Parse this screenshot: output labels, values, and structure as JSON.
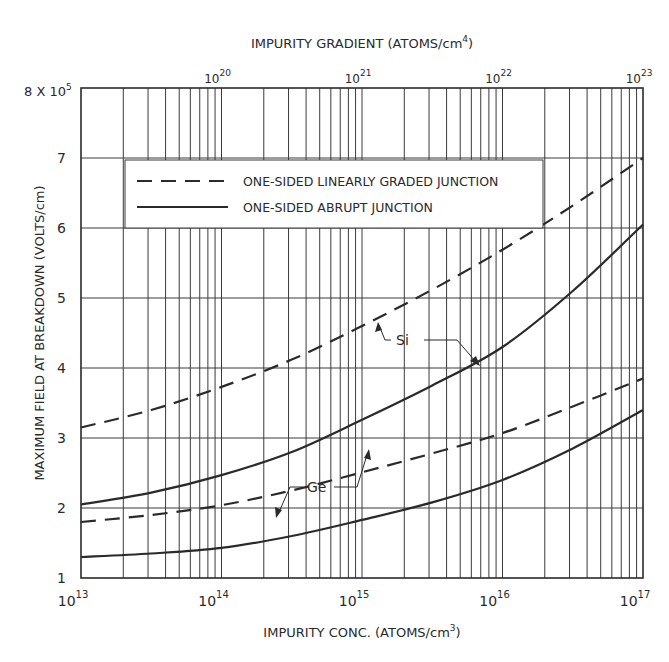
{
  "chart_data": {
    "type": "line",
    "title": "",
    "xlabel": "IMPURITY CONC. (ATOMS/cm3)",
    "xlabel_parts": {
      "main": "IMPURITY  CONC.  (ATOMS/cm",
      "sup": "3",
      "end": ")"
    },
    "x2label": "IMPURITY GRADIENT (ATOMS/cm4)",
    "x2label_parts": {
      "main": "IMPURITY  GRADIENT  (ATOMS/cm",
      "sup": "4",
      "end": ")"
    },
    "ylabel": "MAXIMUM  FIELD  AT  BREAKDOWN  (VOLTS/cm)",
    "xscale": "log",
    "xlim": [
      10000000000000.0,
      1e+17
    ],
    "x2lim": [
      1e+19,
      1e+23
    ],
    "ylim": [
      1,
      8
    ],
    "y_multiplier_label": {
      "base": "8 X 10",
      "exp": "5"
    },
    "y_ticks": [
      "1",
      "2",
      "3",
      "4",
      "5",
      "6",
      "7"
    ],
    "x_ticks": [
      {
        "base": "10",
        "exp": "13"
      },
      {
        "base": "10",
        "exp": "14"
      },
      {
        "base": "10",
        "exp": "15"
      },
      {
        "base": "10",
        "exp": "16"
      },
      {
        "base": "10",
        "exp": "17"
      }
    ],
    "x2_ticks": [
      {
        "base": "10",
        "exp": "20"
      },
      {
        "base": "10",
        "exp": "21"
      },
      {
        "base": "10",
        "exp": "22"
      },
      {
        "base": "10",
        "exp": "23"
      }
    ],
    "grid": true,
    "legend": [
      {
        "label": "ONE-SIDED LINEARLY GRADED JUNCTION",
        "style": "dashed"
      },
      {
        "label": "ONE-SIDED ABRUPT JUNCTION",
        "style": "solid"
      }
    ],
    "legend_position": "upper-left inside",
    "x_log10": [
      13,
      13.5,
      14,
      14.5,
      15,
      15.5,
      16,
      16.5,
      17
    ],
    "series": [
      {
        "name": "Si linearly graded",
        "material": "Si",
        "style": "dashed",
        "values": [
          3.15,
          3.4,
          3.73,
          4.12,
          4.6,
          5.12,
          5.69,
          6.32,
          7.0
        ]
      },
      {
        "name": "Si abrupt",
        "material": "Si",
        "style": "solid",
        "values": [
          2.05,
          2.22,
          2.47,
          2.8,
          3.26,
          3.75,
          4.3,
          5.1,
          6.05
        ]
      },
      {
        "name": "Ge linearly graded",
        "material": "Ge",
        "style": "dashed",
        "values": [
          1.8,
          1.9,
          2.04,
          2.25,
          2.51,
          2.78,
          3.07,
          3.45,
          3.85
        ]
      },
      {
        "name": "Ge abrupt",
        "material": "Ge",
        "style": "solid",
        "values": [
          1.3,
          1.35,
          1.43,
          1.6,
          1.83,
          2.08,
          2.4,
          2.85,
          3.4
        ]
      }
    ],
    "annotations": [
      {
        "text": "Si",
        "points_to": [
          "Si linearly graded",
          "Si abrupt"
        ]
      },
      {
        "text": "Ge",
        "points_to": [
          "Ge abrupt",
          "Ge linearly graded"
        ]
      }
    ]
  },
  "colors": {
    "ink": "#2a2a2a",
    "grid": "#3a3a3a",
    "background": "#ffffff"
  }
}
